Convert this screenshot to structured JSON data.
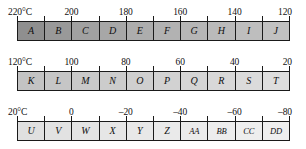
{
  "diagram": {
    "colors": {
      "border": "#1a1a1a",
      "text": "#101010",
      "gradient_start": "#8f8f8f",
      "gradient_end": "#efefef"
    },
    "rows": [
      {
        "id": "row-0",
        "unit_label": "220°C",
        "axis_labels": [
          "220°C",
          "200",
          "180",
          "160",
          "140",
          "120"
        ],
        "axis_values": [
          220,
          200,
          180,
          160,
          140,
          120
        ],
        "tick_count": 11,
        "cells": [
          {
            "label": "A",
            "shade": "#8f8f8f"
          },
          {
            "label": "B",
            "shade": "#999999"
          },
          {
            "label": "C",
            "shade": "#a1a1a1"
          },
          {
            "label": "D",
            "shade": "#a7a7a7"
          },
          {
            "label": "E",
            "shade": "#adadad"
          },
          {
            "label": "F",
            "shade": "#b2b2b2"
          },
          {
            "label": "G",
            "shade": "#b6b6b6"
          },
          {
            "label": "H",
            "shade": "#bababa"
          },
          {
            "label": "I",
            "shade": "#bebebe"
          },
          {
            "label": "J",
            "shade": "#c1c1c1"
          }
        ]
      },
      {
        "id": "row-1",
        "unit_label": "120°C",
        "axis_labels": [
          "120°C",
          "100",
          "80",
          "60",
          "40",
          "20"
        ],
        "axis_values": [
          120,
          100,
          80,
          60,
          40,
          20
        ],
        "tick_count": 11,
        "cells": [
          {
            "label": "K",
            "shade": "#c3c3c3"
          },
          {
            "label": "L",
            "shade": "#c6c6c6"
          },
          {
            "label": "M",
            "shade": "#c9c9c9"
          },
          {
            "label": "N",
            "shade": "#cccccc"
          },
          {
            "label": "O",
            "shade": "#cfcfcf"
          },
          {
            "label": "P",
            "shade": "#d2d2d2"
          },
          {
            "label": "Q",
            "shade": "#d5d5d5"
          },
          {
            "label": "R",
            "shade": "#d8d8d8"
          },
          {
            "label": "S",
            "shade": "#dbdbdb"
          },
          {
            "label": "T",
            "shade": "#dedede"
          }
        ]
      },
      {
        "id": "row-2",
        "unit_label": "20°C",
        "axis_labels": [
          "20°C",
          "0",
          "–20",
          "–40",
          "–60",
          "–80"
        ],
        "axis_values": [
          20,
          0,
          -20,
          -40,
          -60,
          -80
        ],
        "tick_count": 11,
        "cells": [
          {
            "label": "U",
            "shade": "#e0e0e0"
          },
          {
            "label": "V",
            "shade": "#e2e2e2"
          },
          {
            "label": "W",
            "shade": "#e4e4e4"
          },
          {
            "label": "X",
            "shade": "#e6e6e6"
          },
          {
            "label": "Y",
            "shade": "#e8e8e8"
          },
          {
            "label": "Z",
            "shade": "#eaeaea"
          },
          {
            "label": "AA",
            "shade": "#ebebeb"
          },
          {
            "label": "BB",
            "shade": "#ededed"
          },
          {
            "label": "CC",
            "shade": "#eeeeee"
          },
          {
            "label": "DD",
            "shade": "#efefef"
          }
        ]
      }
    ]
  }
}
